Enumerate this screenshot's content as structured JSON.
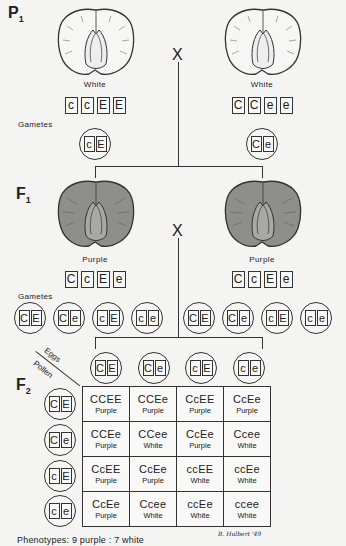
{
  "generations": {
    "p1": {
      "label": "P",
      "subscript": "1",
      "left": {
        "phenotype": "White",
        "genotype": [
          "c",
          "c",
          "E",
          "E"
        ],
        "gamete": [
          "c",
          "E"
        ]
      },
      "right": {
        "phenotype": "White",
        "genotype": [
          "C",
          "C",
          "e",
          "e"
        ],
        "gamete": [
          "C",
          "e"
        ]
      },
      "cross_symbol": "X"
    },
    "f1": {
      "label": "F",
      "subscript": "1",
      "left": {
        "phenotype": "Purple",
        "genotype": [
          "C",
          "c",
          "E",
          "e"
        ],
        "gametes": [
          [
            "C",
            "E"
          ],
          [
            "C",
            "e"
          ],
          [
            "c",
            "E"
          ],
          [
            "c",
            "e"
          ]
        ]
      },
      "right": {
        "phenotype": "Purple",
        "genotype": [
          "C",
          "c",
          "E",
          "e"
        ],
        "gametes": [
          [
            "C",
            "E"
          ],
          [
            "C",
            "e"
          ],
          [
            "c",
            "E"
          ],
          [
            "c",
            "e"
          ]
        ]
      },
      "cross_symbol": "X"
    },
    "f2": {
      "label": "F",
      "subscript": "2",
      "eggs_label": "Eggs",
      "pollen_label": "Pollen",
      "eggs": [
        [
          "C",
          "E"
        ],
        [
          "C",
          "e"
        ],
        [
          "c",
          "E"
        ],
        [
          "c",
          "e"
        ]
      ],
      "pollen": [
        [
          "C",
          "E"
        ],
        [
          "C",
          "e"
        ],
        [
          "c",
          "E"
        ],
        [
          "c",
          "e"
        ]
      ],
      "grid": [
        [
          {
            "g": "CCEE",
            "p": "Purple"
          },
          {
            "g": "CCEe",
            "p": "Purple"
          },
          {
            "g": "CcEE",
            "p": "Purple"
          },
          {
            "g": "CcEe",
            "p": "Purple"
          }
        ],
        [
          {
            "g": "CCEe",
            "p": "Purple"
          },
          {
            "g": "CCee",
            "p": "White"
          },
          {
            "g": "CcEe",
            "p": "Purple"
          },
          {
            "g": "Ccee",
            "p": "White"
          }
        ],
        [
          {
            "g": "CcEE",
            "p": "Purple"
          },
          {
            "g": "CcEe",
            "p": "Purple"
          },
          {
            "g": "ccEE",
            "p": "White"
          },
          {
            "g": "ccEe",
            "p": "White"
          }
        ],
        [
          {
            "g": "CcEe",
            "p": "Purple"
          },
          {
            "g": "Ccee",
            "p": "White"
          },
          {
            "g": "ccEe",
            "p": "White"
          },
          {
            "g": "ccee",
            "p": "White"
          }
        ]
      ]
    }
  },
  "labels": {
    "gametes": "Gametes",
    "phenotypes": "Phenotypes: 9 purple : 7 white",
    "signature": "B. Hulbert '49"
  },
  "colors": {
    "ink": "#222222",
    "purple_seed_fill": "#8a8a8a",
    "white_seed_fill": "#f4f4f2"
  }
}
